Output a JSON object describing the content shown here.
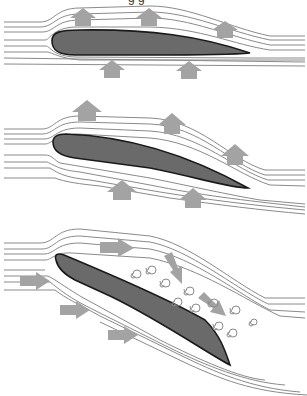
{
  "diagram": {
    "title_fragment": "g g",
    "panels": [
      {
        "id": "low-angle",
        "label": "Airfoil at low angle of attack",
        "lift_arrows": 5
      },
      {
        "id": "moderate-angle",
        "label": "Airfoil at moderate angle of attack",
        "lift_arrows": 5
      },
      {
        "id": "stall",
        "label": "Airfoil at high angle of attack (stall) with turbulent vortices",
        "flow_arrows": 6,
        "vortices": 14
      }
    ],
    "colors": {
      "airfoil_fill": "#6a6a6a",
      "airfoil_outline": "#1a1a1a",
      "arrows": "#a3a3a3",
      "streamlines": "#8a8a8a",
      "background": "#ffffff"
    }
  }
}
